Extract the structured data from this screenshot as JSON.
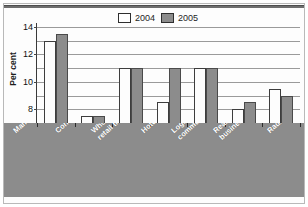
{
  "chart_data": {
    "type": "bar",
    "title": "",
    "subtitle": "",
    "xlabel": "",
    "ylabel": "Per cent",
    "ylim": [
      0,
      14
    ],
    "yticks": [
      0,
      2,
      4,
      6,
      8,
      10,
      12,
      14
    ],
    "grid": true,
    "legend_position": "top-center",
    "categories": [
      "Manufacturing",
      "Construction",
      "Wholesale and\nretail trade",
      "Hotels",
      "Logistics,\ncommunication",
      "Real estate,\nbusiness activities",
      "Radio, film, TV"
    ],
    "series": [
      {
        "name": "2004",
        "color": "#ffffff",
        "values": [
          12,
          1,
          8,
          3,
          8,
          2,
          5
        ]
      },
      {
        "name": "2005",
        "color": "#8c8c8c",
        "values": [
          13,
          1,
          8,
          8,
          8,
          3,
          4
        ]
      }
    ]
  },
  "legend": {
    "items": [
      {
        "label": "2004",
        "swatch": "white-swatch-icon"
      },
      {
        "label": "2005",
        "swatch": "gray-swatch-icon"
      }
    ]
  },
  "axis": {
    "y_title": "Per cent",
    "y_tick_labels": [
      "14",
      "12",
      "10",
      "8",
      "6",
      "4",
      "2",
      "0"
    ]
  },
  "colors": {
    "series_2004": "#ffffff",
    "series_2005": "#8c8c8c",
    "category_band": "#8c8c8c",
    "gridline": "#9a9a9a",
    "frame": "#b9b9b9",
    "text": "#1d1d1d"
  }
}
